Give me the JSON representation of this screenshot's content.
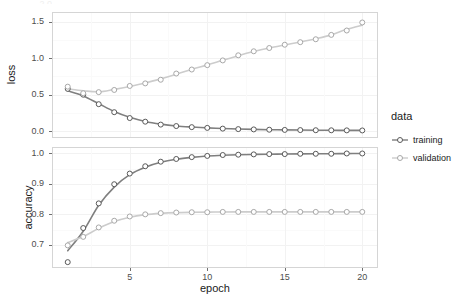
{
  "chart_data": {
    "type": "line",
    "title": "",
    "subtitle": "",
    "xlabel": "epoch",
    "ylabel": "",
    "grid": true,
    "legend_position": "right",
    "legend_title": "data",
    "facets": [
      {
        "name": "loss",
        "ylabel": "loss",
        "ylim": [
          -0.08,
          1.62
        ],
        "yticks": [
          0.0,
          0.5,
          1.0,
          1.5
        ],
        "ytick_labels": [
          "0.0",
          "0.5",
          "1.0",
          "1.5"
        ],
        "xlim": [
          0.05,
          20.95
        ],
        "xticks": [
          5,
          10,
          15,
          20
        ],
        "xtick_labels": [
          "5",
          "10",
          "15",
          "20"
        ],
        "x": [
          1,
          2,
          3,
          4,
          5,
          6,
          7,
          8,
          9,
          10,
          11,
          12,
          13,
          14,
          15,
          16,
          17,
          18,
          19,
          20
        ],
        "series": [
          {
            "name": "training",
            "color": "#7f7f7f",
            "values": [
              0.58,
              0.5,
              0.37,
              0.26,
              0.18,
              0.13,
              0.09,
              0.07,
              0.055,
              0.045,
              0.035,
              0.028,
              0.024,
              0.02,
              0.017,
              0.015,
              0.013,
              0.012,
              0.011,
              0.01
            ]
          },
          {
            "name": "validation",
            "color": "#cccccc",
            "values": [
              0.61,
              0.52,
              0.535,
              0.565,
              0.62,
              0.655,
              0.705,
              0.79,
              0.845,
              0.905,
              0.97,
              1.04,
              1.095,
              1.14,
              1.185,
              1.22,
              1.26,
              1.32,
              1.38,
              1.49
            ]
          }
        ]
      },
      {
        "name": "accuracy",
        "ylabel": "accuracy",
        "ylim": [
          0.627,
          1.018
        ],
        "yticks": [
          0.7,
          0.8,
          0.9,
          1.0
        ],
        "ytick_labels": [
          "0.7",
          "0.8",
          "0.9",
          "1.0"
        ],
        "xlim": [
          0.05,
          20.95
        ],
        "xticks": [
          5,
          10,
          15,
          20
        ],
        "xtick_labels": [
          "5",
          "10",
          "15",
          "20"
        ],
        "x": [
          1,
          2,
          3,
          4,
          5,
          6,
          7,
          8,
          9,
          10,
          11,
          12,
          13,
          14,
          15,
          16,
          17,
          18,
          19,
          20
        ],
        "series": [
          {
            "name": "training",
            "color": "#7f7f7f",
            "values": [
              0.643,
              0.755,
              0.836,
              0.899,
              0.934,
              0.958,
              0.973,
              0.982,
              0.988,
              0.992,
              0.995,
              0.996,
              0.997,
              0.998,
              0.998,
              0.999,
              0.999,
              0.999,
              1.0,
              1.0
            ]
          },
          {
            "name": "validation",
            "color": "#cccccc",
            "values": [
              0.698,
              0.726,
              0.757,
              0.779,
              0.793,
              0.8,
              0.804,
              0.806,
              0.807,
              0.807,
              0.808,
              0.808,
              0.808,
              0.808,
              0.808,
              0.808,
              0.808,
              0.808,
              0.808,
              0.808
            ]
          }
        ]
      }
    ]
  },
  "legend": {
    "title": "data",
    "items": [
      {
        "label": "training",
        "color": "#7f7f7f"
      },
      {
        "label": "validation",
        "color": "#cccccc"
      }
    ]
  },
  "axes": {
    "x_title": "epoch",
    "loss_y_title": "loss",
    "accuracy_y_title": "accuracy",
    "x_tick_labels": [
      "5",
      "10",
      "15",
      "20"
    ],
    "loss_y_tick_labels": [
      "1.5",
      "1.0",
      "0.5",
      "0.0"
    ],
    "accuracy_y_tick_labels": [
      "1.0",
      "0.9",
      "0.8",
      "0.7"
    ]
  },
  "artifacts": {
    "top_clipped_label": "2.0"
  },
  "colors": {
    "training": "#7f7f7f",
    "validation": "#cccccc",
    "panel_border": "#d5d5d5",
    "gridline_major": "#f2f2f2",
    "gridline_minor": "#fafafa",
    "background": "#ffffff",
    "axis_text": "#4d4d4d",
    "title_text": "#1a1a1a"
  }
}
